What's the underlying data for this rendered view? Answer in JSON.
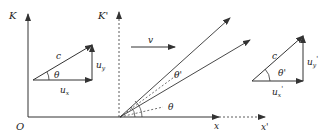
{
  "diagram": {
    "colors": {
      "stroke": "#333333",
      "text": "#222222",
      "background": "#ffffff"
    },
    "frame_K": {
      "axis_label": "K",
      "origin_label": "O",
      "x_label": "x"
    },
    "frame_K_prime": {
      "axis_label": "K'",
      "x_label": "x'"
    },
    "velocity": {
      "label": "v"
    },
    "left_triangle": {
      "hyp_label": "c",
      "angle_label": "θ",
      "x_comp_label": "u",
      "x_sub": "x",
      "y_comp_label": "u",
      "y_sub": "y"
    },
    "right_triangle": {
      "hyp_label": "c",
      "angle_label": "θ'",
      "x_comp_label": "u",
      "x_sub": "x",
      "x_prime": "'",
      "y_comp_label": "u",
      "y_sub": "y",
      "y_prime": "'"
    },
    "rays": {
      "angle_theta": "θ",
      "angle_theta_prime": "θ'"
    }
  }
}
